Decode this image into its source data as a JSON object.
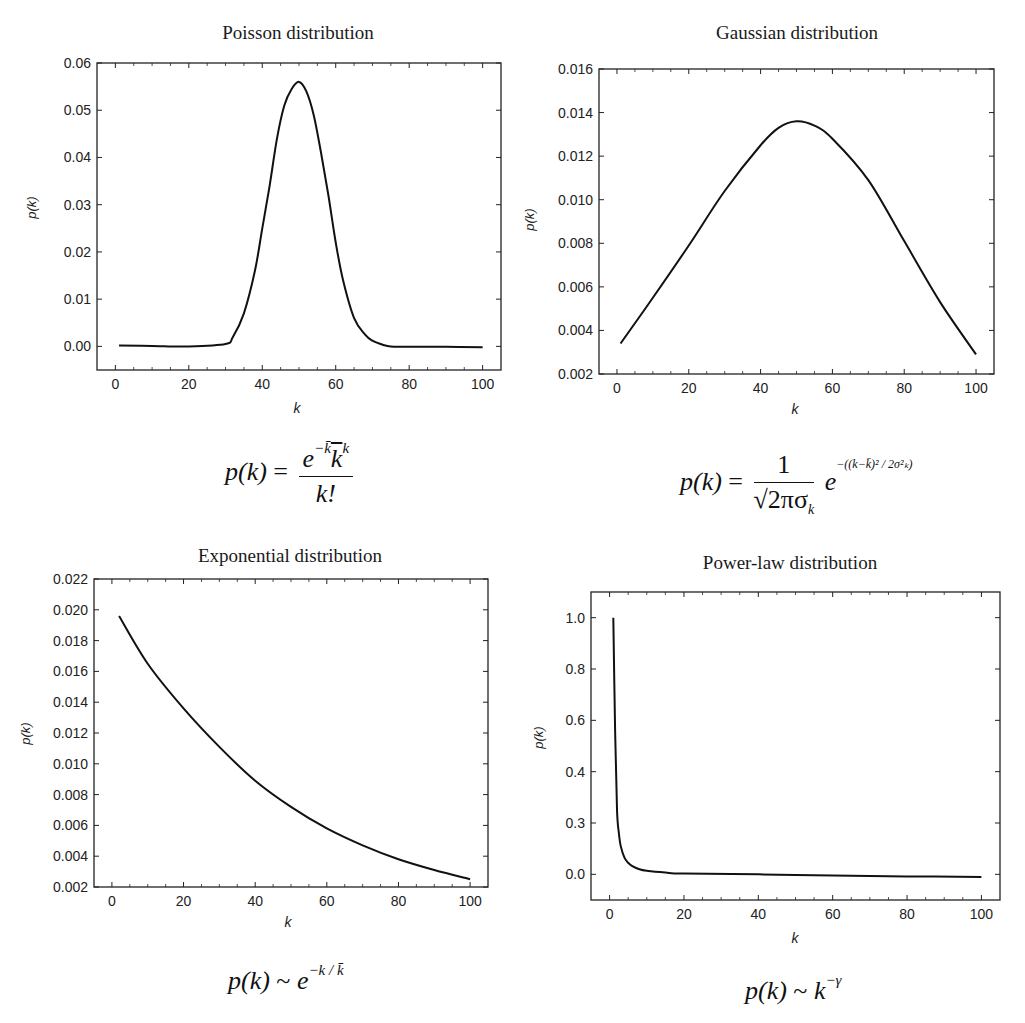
{
  "chart_data": [
    {
      "type": "line",
      "title": "Poisson distribution",
      "xlabel": "k",
      "ylabel": "p(k)",
      "xlim": [
        -5,
        105
      ],
      "ylim": [
        -0.005,
        0.06
      ],
      "xticks": [
        "0",
        "20",
        "40",
        "60",
        "80",
        "100"
      ],
      "yticks": [
        "0.00",
        "0.01",
        "0.02",
        "0.03",
        "0.04",
        "0.05",
        "0.06"
      ],
      "grid": false,
      "x": [
        1,
        10,
        20,
        30,
        32,
        35,
        38,
        40,
        42,
        44,
        46,
        48,
        50,
        52,
        54,
        56,
        58,
        60,
        62,
        65,
        68,
        70,
        73,
        75,
        80,
        90,
        100
      ],
      "series": [
        {
          "name": "Poisson",
          "values": [
            0.0002,
            0.0001,
            0.0,
            0.0005,
            0.002,
            0.007,
            0.016,
            0.025,
            0.034,
            0.044,
            0.051,
            0.0545,
            0.056,
            0.054,
            0.049,
            0.041,
            0.032,
            0.022,
            0.014,
            0.006,
            0.0025,
            0.0012,
            0.0003,
            0.0,
            -0.0001,
            -0.0001,
            -0.0002
          ]
        }
      ],
      "formula": "p(k) = e^{-k̄} k̄^k / k!"
    },
    {
      "type": "line",
      "title": "Gaussian distribution",
      "xlabel": "k",
      "ylabel": "p(k)",
      "xlim": [
        -5,
        105
      ],
      "ylim": [
        0.002,
        0.016
      ],
      "xticks": [
        "0",
        "20",
        "40",
        "60",
        "80",
        "100"
      ],
      "yticks": [
        "0.002",
        "0.004",
        "0.006",
        "0.008",
        "0.010",
        "0.012",
        "0.014",
        "0.016"
      ],
      "grid": false,
      "x": [
        1,
        10,
        20,
        30,
        40,
        45,
        50,
        55,
        60,
        70,
        80,
        90,
        100
      ],
      "series": [
        {
          "name": "Gaussian",
          "values": [
            0.0034,
            0.0055,
            0.0079,
            0.0104,
            0.0125,
            0.0133,
            0.0136,
            0.0134,
            0.0128,
            0.0109,
            0.0081,
            0.0053,
            0.0029
          ]
        }
      ],
      "formula": "p(k) = 1/(√(2π) σ_k) · e^{-((k-k̄)^2 / (2σ_k^2))}"
    },
    {
      "type": "line",
      "title": "Exponential distribution",
      "xlabel": "k",
      "ylabel": "p(k)",
      "xlim": [
        -5,
        105
      ],
      "ylim": [
        0.002,
        0.022
      ],
      "xticks": [
        "0",
        "20",
        "40",
        "60",
        "80",
        "100"
      ],
      "yticks": [
        "0.002",
        "0.004",
        "0.006",
        "0.008",
        "0.010",
        "0.012",
        "0.014",
        "0.016",
        "0.018",
        "0.020",
        "0.022"
      ],
      "grid": false,
      "x": [
        2,
        10,
        20,
        30,
        40,
        50,
        60,
        70,
        80,
        90,
        100
      ],
      "series": [
        {
          "name": "Exponential",
          "values": [
            0.0196,
            0.0165,
            0.0136,
            0.0111,
            0.0089,
            0.0072,
            0.0058,
            0.0047,
            0.0038,
            0.0031,
            0.0025
          ]
        }
      ],
      "formula": "p(k) ~ e^{-k/k̄}"
    },
    {
      "type": "line",
      "title": "Power-law distribution",
      "xlabel": "k",
      "ylabel": "p(k)",
      "xlim": [
        -5,
        105
      ],
      "ylim": [
        -0.1,
        1.1
      ],
      "xticks": [
        "0",
        "20",
        "40",
        "60",
        "80",
        "100"
      ],
      "yticks": [
        "0.0",
        "0.3",
        "0.4",
        "0.6",
        "0.8",
        "1.0"
      ],
      "ytick_values": [
        0.0,
        0.2,
        0.4,
        0.6,
        0.8,
        1.0
      ],
      "grid": false,
      "x": [
        1,
        1.5,
        2,
        2.5,
        3,
        4,
        5,
        6,
        8,
        10,
        15,
        20,
        40,
        60,
        80,
        100
      ],
      "series": [
        {
          "name": "Power-law",
          "values": [
            1.0,
            0.55,
            0.25,
            0.16,
            0.11,
            0.065,
            0.045,
            0.033,
            0.02,
            0.014,
            0.007,
            0.003,
            0.0,
            -0.005,
            -0.008,
            -0.01
          ]
        }
      ],
      "formula": "p(k) ~ k^{-γ}"
    }
  ],
  "panels": {
    "poisson": {
      "title": "Poisson distribution",
      "xlabel": "k",
      "ylabel": "p(k)",
      "formula": {
        "lhs": "p(k)",
        "eq": "=",
        "num_base": "e",
        "num_exp": "−k̄",
        "num_k": "k",
        "num_kexp": "k",
        "den": "k!"
      }
    },
    "gaussian": {
      "title": "Gaussian distribution",
      "xlabel": "k",
      "ylabel": "p(k)",
      "formula": {
        "lhs": "p(k)",
        "eq": "=",
        "num": "1",
        "den": "√2πσ",
        "den_sub": "k",
        "base": "e",
        "exp": "−((k−k̄)² / 2σ²ₖ)"
      }
    },
    "exponential": {
      "title": "Exponential distribution",
      "xlabel": "k",
      "ylabel": "p(k)",
      "formula": {
        "lhs": "p(k)",
        "rel": "~",
        "base": "e",
        "exp": "−k / k̄"
      }
    },
    "powerlaw": {
      "title": "Power-law distribution",
      "xlabel": "k",
      "ylabel": "p(k)",
      "formula": {
        "lhs": "p(k)",
        "rel": "~",
        "base": "k",
        "exp": "−γ"
      }
    }
  }
}
